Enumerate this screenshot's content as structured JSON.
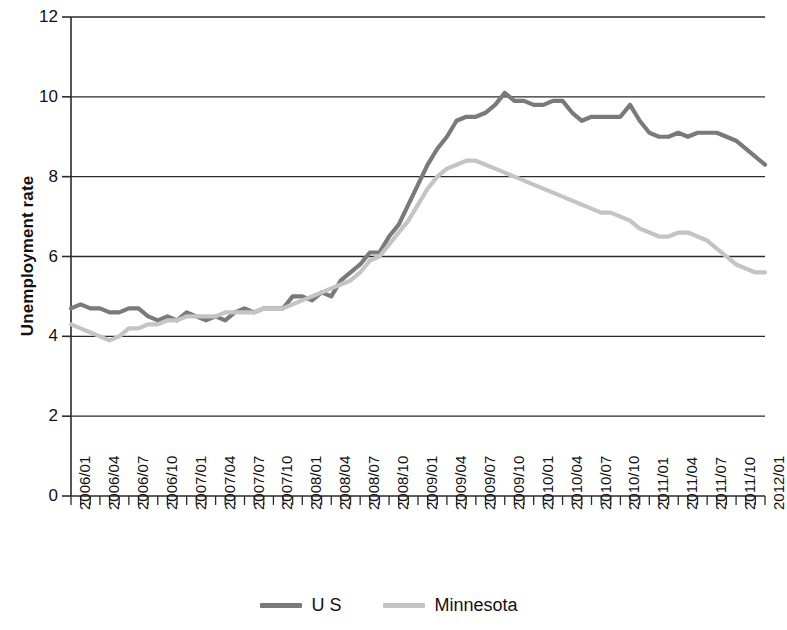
{
  "chart_data": {
    "type": "line",
    "title": "",
    "xlabel": "",
    "ylabel": "Unemployment rate",
    "ylim": [
      0,
      12
    ],
    "yticks": [
      0,
      2,
      4,
      6,
      8,
      10,
      12
    ],
    "grid": true,
    "legend_position": "bottom",
    "x": [
      "2006/01",
      "2006/02",
      "2006/03",
      "2006/04",
      "2006/05",
      "2006/06",
      "2006/07",
      "2006/08",
      "2006/09",
      "2006/10",
      "2006/11",
      "2006/12",
      "2007/01",
      "2007/02",
      "2007/03",
      "2007/04",
      "2007/05",
      "2007/06",
      "2007/07",
      "2007/08",
      "2007/09",
      "2007/10",
      "2007/11",
      "2007/12",
      "2008/01",
      "2008/02",
      "2008/03",
      "2008/04",
      "2008/05",
      "2008/06",
      "2008/07",
      "2008/08",
      "2008/09",
      "2008/10",
      "2008/11",
      "2008/12",
      "2009/01",
      "2009/02",
      "2009/03",
      "2009/04",
      "2009/05",
      "2009/06",
      "2009/07",
      "2009/08",
      "2009/09",
      "2009/10",
      "2009/11",
      "2009/12",
      "2010/01",
      "2010/02",
      "2010/03",
      "2010/04",
      "2010/05",
      "2010/06",
      "2010/07",
      "2010/08",
      "2010/09",
      "2010/10",
      "2010/11",
      "2010/12",
      "2011/01",
      "2011/02",
      "2011/03",
      "2011/04",
      "2011/05",
      "2011/06",
      "2011/07",
      "2011/08",
      "2011/09",
      "2011/10",
      "2011/11",
      "2011/12",
      "2012/01"
    ],
    "xtick_labels": [
      "2006/01",
      "2006/04",
      "2006/07",
      "2006/10",
      "2007/01",
      "2007/04",
      "2007/07",
      "2007/10",
      "2008/01",
      "2008/04",
      "2008/07",
      "2008/10",
      "2009/01",
      "2009/04",
      "2009/07",
      "2009/10",
      "2010/01",
      "2010/04",
      "2010/07",
      "2010/10",
      "2011/01",
      "2011/04",
      "2011/07",
      "2011/10",
      "2012/01"
    ],
    "series": [
      {
        "name": "U S",
        "color": "#7a7a7a",
        "values": [
          4.7,
          4.8,
          4.7,
          4.7,
          4.6,
          4.6,
          4.7,
          4.7,
          4.5,
          4.4,
          4.5,
          4.4,
          4.6,
          4.5,
          4.4,
          4.5,
          4.4,
          4.6,
          4.7,
          4.6,
          4.7,
          4.7,
          4.7,
          5.0,
          5.0,
          4.9,
          5.1,
          5.0,
          5.4,
          5.6,
          5.8,
          6.1,
          6.1,
          6.5,
          6.8,
          7.3,
          7.8,
          8.3,
          8.7,
          9.0,
          9.4,
          9.5,
          9.5,
          9.6,
          9.8,
          10.1,
          9.9,
          9.9,
          9.8,
          9.8,
          9.9,
          9.9,
          9.6,
          9.4,
          9.5,
          9.5,
          9.5,
          9.5,
          9.8,
          9.4,
          9.1,
          9.0,
          9.0,
          9.1,
          9.0,
          9.1,
          9.1,
          9.1,
          9.0,
          8.9,
          8.7,
          8.5,
          8.3
        ]
      },
      {
        "name": "Minnesota",
        "color": "#c4c4c4",
        "values": [
          4.3,
          4.2,
          4.1,
          4.0,
          3.9,
          4.0,
          4.2,
          4.2,
          4.3,
          4.3,
          4.4,
          4.4,
          4.5,
          4.5,
          4.5,
          4.5,
          4.6,
          4.6,
          4.6,
          4.6,
          4.7,
          4.7,
          4.7,
          4.8,
          4.9,
          5.0,
          5.1,
          5.2,
          5.3,
          5.4,
          5.6,
          5.9,
          6.0,
          6.3,
          6.6,
          6.9,
          7.3,
          7.7,
          8.0,
          8.2,
          8.3,
          8.4,
          8.4,
          8.3,
          8.2,
          8.1,
          8.0,
          7.9,
          7.8,
          7.7,
          7.6,
          7.5,
          7.4,
          7.3,
          7.2,
          7.1,
          7.1,
          7.0,
          6.9,
          6.7,
          6.6,
          6.5,
          6.5,
          6.6,
          6.6,
          6.5,
          6.4,
          6.2,
          6.0,
          5.8,
          5.7,
          5.6,
          5.6
        ]
      }
    ]
  },
  "legend": {
    "items": [
      {
        "label": "U S",
        "color": "#7a7a7a"
      },
      {
        "label": "Minnesota",
        "color": "#c4c4c4"
      }
    ]
  },
  "axes": {
    "y_title": "Unemployment rate"
  }
}
